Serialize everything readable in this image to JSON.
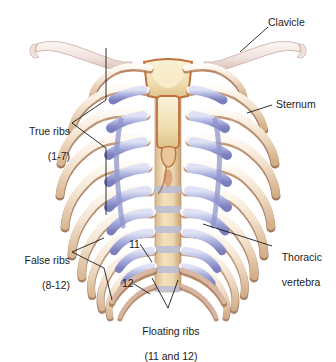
{
  "figure": {
    "title_clipped": "Sternum, clavicle, and ribs",
    "background_color": "#ffffff"
  },
  "palette": {
    "bone_light": "#f6ece2",
    "bone_mid": "#e8d6c0",
    "bone_shadow": "#a8764e",
    "bone_deep_shadow": "#8a5a39",
    "cartilage_light": "#c9cdea",
    "cartilage_mid": "#9aa0d4",
    "cartilage_dark": "#7b80bd",
    "sternum_fill": "#f3e3b8",
    "sternum_edge": "#c0703c",
    "vertebra_fill": "#edd9b4",
    "vertebra_disc": "#b9bcd8",
    "clavicle_fill": "#f4e9e6",
    "leader_line": "#1a1a1a",
    "text": "#1b1b1b"
  },
  "labels": [
    {
      "id": "clavicle",
      "text": "Clavicle",
      "line2": ""
    },
    {
      "id": "sternum",
      "text": "Sternum",
      "line2": ""
    },
    {
      "id": "thoracic",
      "text": "Thoracic",
      "line2": "vertebra"
    },
    {
      "id": "true_ribs",
      "text": "True ribs",
      "line2": "(1-7)"
    },
    {
      "id": "false_ribs",
      "text": "False ribs",
      "line2": "(8-12)"
    },
    {
      "id": "floating_ribs",
      "text": "Floating ribs",
      "line2": "(11 and 12)"
    }
  ],
  "rib_numbers": [
    {
      "id": "rib-11",
      "text": "11"
    },
    {
      "id": "rib-12",
      "text": "12"
    }
  ],
  "anatomy": {
    "true_ribs_range": "1-7",
    "false_ribs_range": "8-12",
    "floating_ribs_range": "11 and 12",
    "rib_pairs_total": 12
  }
}
